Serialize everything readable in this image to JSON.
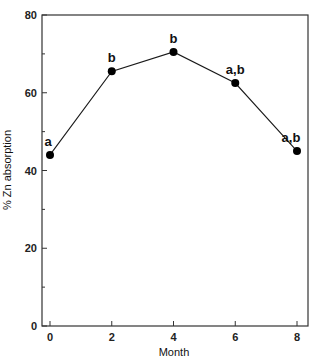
{
  "chart_data": {
    "type": "line",
    "title": "",
    "xlabel": "Month",
    "ylabel": "% Zn absorption",
    "x": [
      0,
      2,
      4,
      6,
      8
    ],
    "series": [
      {
        "name": "% Zn absorption",
        "values": [
          44,
          65.5,
          70.5,
          62.5,
          45
        ],
        "point_labels": [
          "a",
          "b",
          "b",
          "a,b",
          "a,b"
        ]
      }
    ],
    "xlim": [
      -0.2,
      8.3
    ],
    "ylim": [
      0,
      80
    ],
    "xticks": [
      "0",
      "2",
      "4",
      "6",
      "8"
    ],
    "yticks": [
      "0",
      "20",
      "40",
      "60",
      "80"
    ],
    "grid": false,
    "legend": null,
    "colors": {
      "line": "#1a1a1a",
      "marker": "#000000",
      "axis": "#333333"
    }
  }
}
